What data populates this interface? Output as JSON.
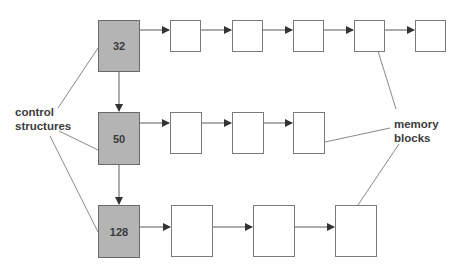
{
  "labels": {
    "control": [
      "control",
      "structures"
    ],
    "memory": [
      "memory",
      "blocks"
    ]
  },
  "control_structures": [
    {
      "value": "32",
      "x": 98,
      "y": 20,
      "w": 42,
      "h": 52
    },
    {
      "value": "50",
      "x": 98,
      "y": 112,
      "w": 42,
      "h": 53
    },
    {
      "value": "128",
      "x": 98,
      "y": 205,
      "w": 42,
      "h": 53
    }
  ],
  "memory_rows": [
    {
      "y": 20,
      "h": 32,
      "boxes": [
        {
          "x": 170,
          "w": 31
        },
        {
          "x": 232,
          "w": 31
        },
        {
          "x": 293,
          "w": 31
        },
        {
          "x": 354,
          "w": 31
        },
        {
          "x": 415,
          "w": 31
        }
      ]
    },
    {
      "y": 112,
      "h": 42,
      "boxes": [
        {
          "x": 170,
          "w": 32
        },
        {
          "x": 232,
          "w": 32
        },
        {
          "x": 293,
          "w": 32
        }
      ]
    },
    {
      "y": 205,
      "h": 52,
      "boxes": [
        {
          "x": 171,
          "w": 42
        },
        {
          "x": 253,
          "w": 42
        },
        {
          "x": 335,
          "w": 42
        }
      ]
    }
  ],
  "colors": {
    "control_fill": "#b4b4b4",
    "line": "#5a5a5a",
    "arrow": "#333333"
  }
}
